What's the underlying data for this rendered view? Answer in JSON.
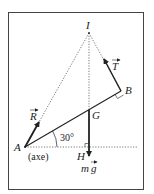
{
  "diagram": {
    "points": {
      "I": "I",
      "A": "A",
      "B": "B",
      "G": "G",
      "H": "H"
    },
    "vectors": {
      "R": "R",
      "T": "T",
      "weight_m": "m",
      "weight_g": "g"
    },
    "angle_label": "30°",
    "axis_label": "(axe)"
  },
  "colors": {
    "line": "#222222",
    "dotted": "#555555",
    "frame": "#444444"
  }
}
